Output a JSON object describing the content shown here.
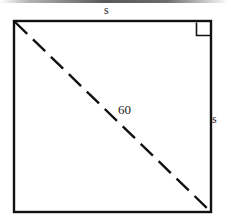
{
  "figure": {
    "kind": "geometry-diagram",
    "background_color": "#ffffff",
    "stroke_color": "#111111",
    "square": {
      "left": 14,
      "top": 21,
      "right": 211,
      "bottom": 212,
      "stroke_width": 2.4
    },
    "diagonal": {
      "from": "top-left",
      "to": "bottom-right",
      "style": "dashed",
      "dash_length": 17,
      "dash_gap": 8,
      "stroke_width": 2.4
    },
    "right_angle_marker": {
      "corner": "top-right",
      "size": 14,
      "stroke_width": 1.6
    },
    "labels": {
      "side_top": "s",
      "side_right": "s",
      "diagonal": "60"
    }
  }
}
